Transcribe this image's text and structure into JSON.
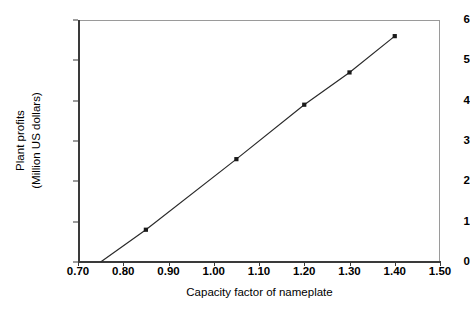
{
  "chart_data": {
    "type": "line",
    "title": "",
    "subtitle": "",
    "xlabel": "Capacity factor of nameplate",
    "ylabel": "Plant profits\n(Million US dollars)",
    "ylabel_line1": "Plant profits",
    "ylabel_line2": "(Million US dollars)",
    "xlim": [
      0.7,
      1.5
    ],
    "ylim": [
      0,
      6
    ],
    "xticks": [
      "0.70",
      "0.80",
      "0.90",
      "1.00",
      "1.10",
      "1.20",
      "1.30",
      "1.40",
      "1.50"
    ],
    "xtick_values": [
      0.7,
      0.8,
      0.9,
      1.0,
      1.1,
      1.2,
      1.3,
      1.4,
      1.5
    ],
    "yticks": [
      "0",
      "1",
      "2",
      "3",
      "4",
      "5",
      "6"
    ],
    "ytick_values": [
      0,
      1,
      2,
      3,
      4,
      5,
      6
    ],
    "grid": false,
    "legend": false,
    "legend_position": "none",
    "line_color": "#2a2a2a",
    "marker_color": "#1a1a1a",
    "marker_shape": "square",
    "series": [
      {
        "name": "Plant profits",
        "x": [
          0.75,
          0.85,
          1.05,
          1.2,
          1.3,
          1.4
        ],
        "y": [
          0.0,
          0.8,
          2.55,
          3.9,
          4.7,
          5.6
        ],
        "markers_shown": [
          false,
          true,
          true,
          true,
          true,
          true
        ]
      }
    ]
  }
}
